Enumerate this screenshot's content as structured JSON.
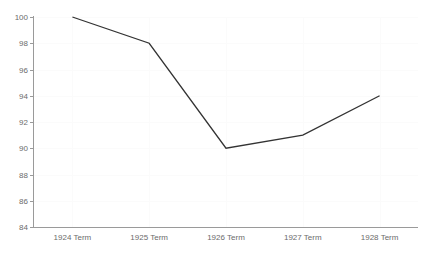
{
  "chart_data": {
    "type": "line",
    "title": "",
    "xlabel": "",
    "ylabel": "",
    "categories": [
      "1924 Term",
      "1925 Term",
      "1926 Term",
      "1927 Term",
      "1928 Term"
    ],
    "series": [
      {
        "name": "series-1",
        "values": [
          100,
          98,
          90,
          91,
          94
        ],
        "color": "#333333"
      }
    ],
    "ylim": [
      84,
      100
    ],
    "yticks": [
      84,
      86,
      88,
      90,
      92,
      94,
      96,
      98,
      100
    ],
    "ytick_labels": [
      "84",
      "86",
      "88",
      "90",
      "92",
      "94",
      "96",
      "98",
      "100"
    ],
    "grid": true,
    "grid_color": "#fbfbfb",
    "legend": false,
    "axis_color": "#9a9a9a",
    "tick_label_color": "#6b6b6b",
    "background": "#ffffff"
  }
}
